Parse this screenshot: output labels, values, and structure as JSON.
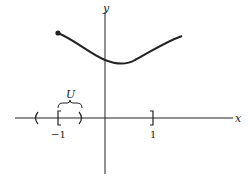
{
  "diagram": {
    "axes": {
      "x_label": "x",
      "y_label": "y"
    },
    "ticks": {
      "left": "−1",
      "right": "1"
    },
    "neighborhood_label": "U",
    "curve": {
      "description": "continuous function on [-1, 1] with closed endpoint at x = -1, minimum slightly right of y-axis"
    },
    "colors": {
      "ink": "#222222",
      "background": "#ffffff"
    }
  }
}
